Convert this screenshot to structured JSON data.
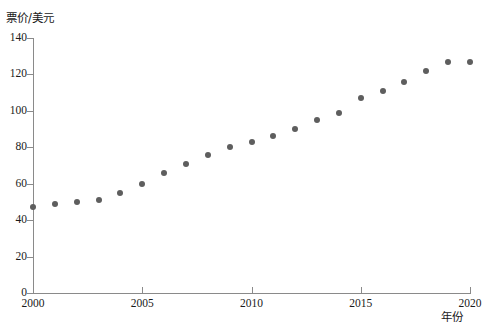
{
  "chart_data": {
    "type": "scatter",
    "title": "",
    "xlabel": "年份",
    "ylabel": "票价/美元",
    "xlim": [
      2000,
      2020
    ],
    "ylim": [
      0,
      140
    ],
    "grid": false,
    "legend": null,
    "xticks": [
      2000,
      2005,
      2010,
      2015,
      2020
    ],
    "xtick_labels": [
      "2000",
      "2005",
      "2010",
      "2015",
      "2020"
    ],
    "yticks": [
      0,
      20,
      40,
      60,
      80,
      100,
      120,
      140
    ],
    "ytick_labels": [
      "0",
      "20",
      "40",
      "60",
      "80",
      "100",
      "120",
      "140"
    ],
    "marker_color": "#5e5e5e",
    "axis_color": "#8a8a8a",
    "x": [
      2000,
      2001,
      2002,
      2003,
      2004,
      2005,
      2006,
      2007,
      2008,
      2009,
      2010,
      2011,
      2012,
      2013,
      2014,
      2015,
      2016,
      2017,
      2018,
      2019,
      2020
    ],
    "values": [
      47,
      49,
      50,
      51,
      55,
      60,
      66,
      71,
      76,
      80,
      83,
      86,
      90,
      95,
      99,
      107,
      111,
      116,
      122,
      127,
      127
    ]
  }
}
